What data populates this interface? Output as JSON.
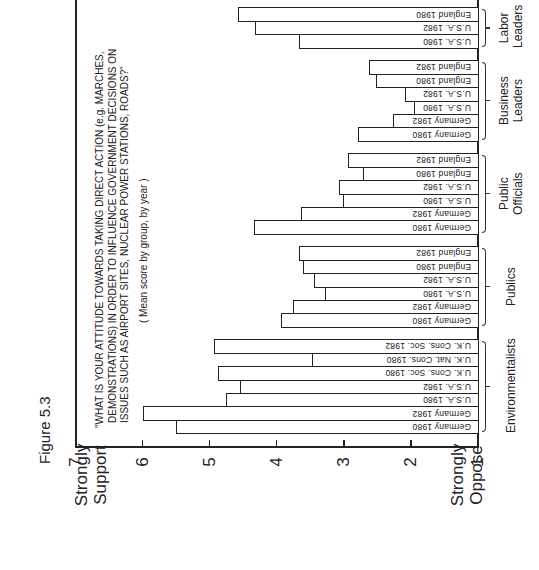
{
  "figure": {
    "label": "Figure 5.3"
  },
  "axis_labels": {
    "top": [
      "Strongly",
      "Support"
    ],
    "bottom": [
      "Strongly",
      "Oppose"
    ]
  },
  "title": {
    "lines": [
      "\"WHAT IS YOUR ATTITUDE TOWARDS TAKING DIRECT ACTION (e.g. MARCHES,",
      "DEMONSTRATIONS) IN ORDER TO INFLUENCE GOVERNMENT DECISIONS ON",
      "ISSUES SUCH AS AIRPORT SITES, NUCLEAR POWER STATIONS, ROADS?\""
    ],
    "subtitle": "( Mean score by group, by year )"
  },
  "chart_data": {
    "type": "bar",
    "orientation": "horizontal (rotated figure)",
    "title": "\"WHAT IS YOUR ATTITUDE TOWARDS TAKING DIRECT ACTION (e.g. MARCHES, DEMONSTRATIONS) IN ORDER TO INFLUENCE GOVERNMENT DECISIONS ON ISSUES SUCH AS AIRPORT SITES, NUCLEAR POWER STATIONS, ROADS?\"",
    "subtitle": "(Mean score by group, by year)",
    "ylabel_high": "Strongly Support",
    "ylabel_low": "Strongly Oppose",
    "ylim": [
      1,
      7
    ],
    "yticks": [
      "1",
      "2",
      "3",
      "4",
      "5",
      "6",
      "7"
    ],
    "grid": false,
    "groups": [
      {
        "name": "Environmentalists",
        "bars": [
          {
            "label": "Germany 1980",
            "value": 5.5
          },
          {
            "label": "Germany 1982",
            "value": 6.0
          },
          {
            "label": "U.S.A. 1980",
            "value": 4.75
          },
          {
            "label": "U.S.A. 1982",
            "value": 4.55
          },
          {
            "label": "U.K. Cons. Soc. 1980",
            "value": 4.87
          },
          {
            "label": "U.K. Nat. Cons. 1980",
            "value": 3.48
          },
          {
            "label": "U.K. Cons. Soc. 1982",
            "value": 4.93
          }
        ]
      },
      {
        "name": "Publics",
        "bars": [
          {
            "label": "Germany 1980",
            "value": 3.94
          },
          {
            "label": "Germany 1982",
            "value": 3.76
          },
          {
            "label": "U.S.A. 1980",
            "value": 3.28
          },
          {
            "label": "U.S.A. 1982",
            "value": 3.45
          },
          {
            "label": "England 1980",
            "value": 3.61
          },
          {
            "label": "England 1982",
            "value": 3.67
          }
        ]
      },
      {
        "name": "Public Officials",
        "bars": [
          {
            "label": "Germany 1980",
            "value": 4.34
          },
          {
            "label": "Germany 1982",
            "value": 3.64
          },
          {
            "label": "U.S.A. 1980",
            "value": 3.01
          },
          {
            "label": "U.S.A. 1982",
            "value": 3.07
          },
          {
            "label": "England 1980",
            "value": 2.72
          },
          {
            "label": "England 1982",
            "value": 2.93
          }
        ]
      },
      {
        "name": "Business Leaders",
        "bars": [
          {
            "label": "Germany 1980",
            "value": 2.79
          },
          {
            "label": "Germany 1982",
            "value": 2.27
          },
          {
            "label": "U.S.A. 1980",
            "value": 1.96
          },
          {
            "label": "U.S.A. 1982",
            "value": 2.09
          },
          {
            "label": "England 1980",
            "value": 2.52
          },
          {
            "label": "England 1982",
            "value": 2.63
          }
        ]
      },
      {
        "name": "Labor Leaders",
        "bars": [
          {
            "label": "U.S.A. 1980",
            "value": 3.67
          },
          {
            "label": "U.S.A. 1982",
            "value": 4.33
          },
          {
            "label": "England 1980",
            "value": 4.57
          }
        ]
      }
    ]
  },
  "group_label_lines": {
    "Environmentalists": [
      "Environmentalists"
    ],
    "Publics": [
      "Publics"
    ],
    "Public Officials": [
      "Public",
      "Officials"
    ],
    "Business Leaders": [
      "Business",
      "Leaders"
    ],
    "Labor Leaders": [
      "Labor",
      "Leaders"
    ]
  }
}
